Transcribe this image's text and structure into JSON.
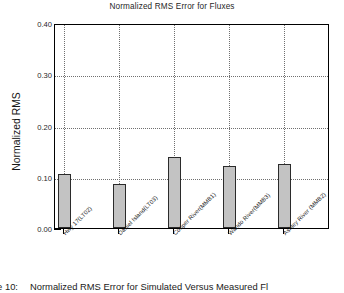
{
  "chart_data": {
    "type": "bar",
    "title": "Normalized RMS Error for Fluxes",
    "xlabel": "",
    "ylabel": "Normalized RMS",
    "ylim": [
      0.0,
      0.4
    ],
    "ytick_labels": [
      "0.00",
      "0.10",
      "0.20",
      "0.30",
      "0.40"
    ],
    "ytick_values": [
      0.0,
      0.1,
      0.2,
      0.3,
      0.4
    ],
    "minor_tick_step": 0.025,
    "grid": "dotted-both",
    "legend": "none",
    "categories": [
      "Hwy 17(LT02)",
      "Daniel Island(LT03)",
      "Cooper River(MMB1)",
      "Wando River(MMB3)",
      "Ashley River (MMB2)"
    ],
    "values": [
      0.107,
      0.086,
      0.139,
      0.123,
      0.127
    ],
    "bar_color": "#c3c3c3",
    "bar_edge_color": "#2b2b2b"
  },
  "caption": {
    "number": "re 10:",
    "text": "Normalized RMS Error for Simulated Versus Measured Fl"
  }
}
